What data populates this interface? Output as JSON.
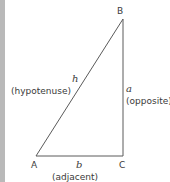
{
  "diagram": {
    "type": "right-triangle",
    "vertices": {
      "A": {
        "label": "A",
        "x": 36,
        "y": 156
      },
      "B": {
        "label": "B",
        "x": 123,
        "y": 19
      },
      "C": {
        "label": "C",
        "x": 123,
        "y": 156
      }
    },
    "sides": {
      "hypotenuse": {
        "symbol": "h",
        "name": "(hypotenuse)"
      },
      "opposite": {
        "symbol": "a",
        "name": "(opposite)"
      },
      "adjacent": {
        "symbol": "b",
        "name": "(adjacent)"
      }
    },
    "colors": {
      "line": "#5a5a5a",
      "text": "#3a3a3a",
      "left_bar": "#b9b9b9"
    }
  }
}
